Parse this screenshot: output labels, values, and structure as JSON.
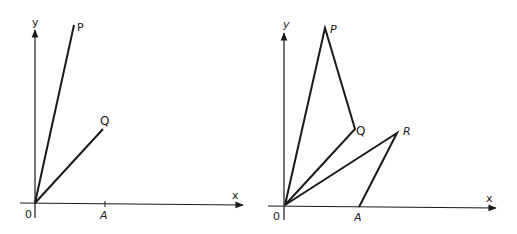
{
  "diagrams": [
    {
      "id": "left",
      "axes": {
        "x_label": "x",
        "y_label": "y",
        "origin_label": "0"
      },
      "points": {
        "O": {
          "label": "0",
          "x": 35,
          "y": 203
        },
        "P": {
          "label": "P",
          "x": 74,
          "y": 25
        },
        "Q": {
          "label": "Q",
          "x": 103,
          "y": 128
        },
        "A": {
          "label": "A",
          "x": 105,
          "y": 204
        }
      },
      "segments": [
        "OP",
        "OQ"
      ]
    },
    {
      "id": "right",
      "axes": {
        "x_label": "x",
        "y_label": "y",
        "origin_label": "0"
      },
      "points": {
        "O": {
          "label": "0",
          "x": 285,
          "y": 206
        },
        "P": {
          "label": "P",
          "x": 325,
          "y": 28
        },
        "Q": {
          "label": "Q",
          "x": 355,
          "y": 129
        },
        "R": {
          "label": "R",
          "x": 397,
          "y": 133
        },
        "A": {
          "label": "A",
          "x": 359,
          "y": 207
        }
      },
      "segments": [
        "OP",
        "PQ",
        "OQ",
        "OR",
        "RA"
      ]
    }
  ],
  "labels": {
    "left_y": "y",
    "left_x": "x",
    "left_o": "0",
    "left_p": "P",
    "left_q": "Q",
    "left_a": "A",
    "right_y": "y",
    "right_x": "x",
    "right_o": "0",
    "right_p": "P",
    "right_q": "Q",
    "right_r": "R",
    "right_a": "A"
  }
}
